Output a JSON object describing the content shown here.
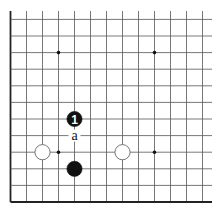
{
  "diagram": {
    "type": "go-board-partial",
    "region": "lower-left corner",
    "columns": 13,
    "rows": 12,
    "colors": {
      "background": "#ffffff",
      "grid": "#555555",
      "edge": "#222222",
      "black_stone": "#111111",
      "white_stone": "#ffffff",
      "white_stone_border": "#666666"
    },
    "star_points": [
      {
        "col": 3,
        "row": 3
      },
      {
        "col": 9,
        "row": 3
      },
      {
        "col": 3,
        "row": 9
      },
      {
        "col": 9,
        "row": 9
      }
    ],
    "stones": [
      {
        "color": "black",
        "col": 4,
        "row": 5,
        "label": "1"
      },
      {
        "color": "black",
        "col": 4,
        "row": 2,
        "label": ""
      },
      {
        "color": "white",
        "col": 2,
        "row": 3,
        "label": ""
      },
      {
        "color": "white",
        "col": 7,
        "row": 3,
        "label": ""
      }
    ],
    "markers": [
      {
        "col": 4,
        "row": 4,
        "label": "a"
      }
    ]
  }
}
